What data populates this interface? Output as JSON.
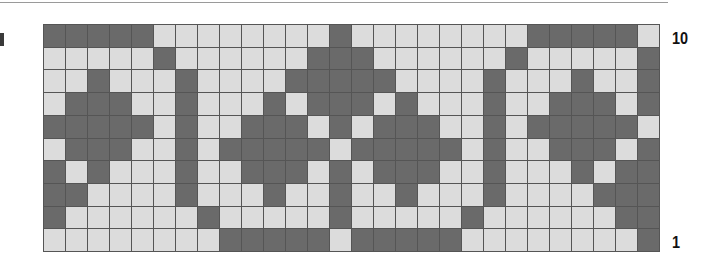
{
  "chart_data": {
    "type": "heatmap",
    "title": "",
    "columns": 28,
    "rows": 10,
    "row_labels": {
      "top": "10",
      "bottom": "1"
    },
    "colors": {
      "dark": "#6a6a6a",
      "light": "#dcdcdc",
      "grid": "#555555"
    },
    "grid": [
      [
        1,
        1,
        1,
        1,
        1,
        0,
        0,
        0,
        0,
        0,
        0,
        0,
        0,
        1,
        0,
        0,
        0,
        0,
        0,
        0,
        0,
        0,
        1,
        1,
        1,
        1,
        1,
        0
      ],
      [
        0,
        0,
        0,
        0,
        0,
        1,
        0,
        0,
        0,
        0,
        0,
        0,
        1,
        1,
        1,
        0,
        0,
        0,
        0,
        0,
        0,
        1,
        0,
        0,
        0,
        0,
        0,
        1
      ],
      [
        0,
        0,
        1,
        0,
        0,
        0,
        1,
        0,
        0,
        0,
        0,
        1,
        1,
        1,
        1,
        1,
        0,
        0,
        0,
        0,
        1,
        0,
        0,
        0,
        1,
        0,
        0,
        1
      ],
      [
        0,
        1,
        1,
        1,
        0,
        0,
        1,
        0,
        0,
        0,
        1,
        0,
        1,
        1,
        1,
        0,
        1,
        0,
        0,
        0,
        1,
        0,
        0,
        1,
        1,
        1,
        0,
        1
      ],
      [
        1,
        1,
        1,
        1,
        1,
        0,
        1,
        0,
        0,
        1,
        1,
        1,
        0,
        1,
        0,
        1,
        1,
        1,
        0,
        0,
        1,
        0,
        1,
        1,
        1,
        1,
        1,
        0
      ],
      [
        0,
        1,
        1,
        1,
        0,
        0,
        1,
        0,
        1,
        1,
        1,
        1,
        1,
        0,
        1,
        1,
        1,
        1,
        1,
        0,
        1,
        0,
        0,
        1,
        1,
        1,
        0,
        1
      ],
      [
        1,
        0,
        1,
        0,
        0,
        0,
        1,
        0,
        0,
        1,
        1,
        1,
        0,
        1,
        0,
        1,
        1,
        1,
        0,
        0,
        1,
        0,
        0,
        0,
        1,
        0,
        1,
        1
      ],
      [
        1,
        1,
        0,
        0,
        0,
        0,
        1,
        0,
        0,
        0,
        1,
        0,
        0,
        1,
        0,
        0,
        1,
        0,
        0,
        0,
        1,
        0,
        0,
        0,
        0,
        1,
        1,
        1
      ],
      [
        1,
        0,
        0,
        0,
        0,
        0,
        0,
        1,
        0,
        0,
        0,
        0,
        0,
        1,
        0,
        0,
        0,
        0,
        0,
        1,
        0,
        0,
        0,
        0,
        0,
        0,
        1,
        1
      ],
      [
        0,
        0,
        0,
        0,
        0,
        0,
        0,
        0,
        1,
        1,
        1,
        1,
        1,
        0,
        1,
        1,
        1,
        1,
        1,
        0,
        0,
        0,
        0,
        0,
        0,
        0,
        0,
        1
      ]
    ]
  },
  "labels": {
    "top_row": "10",
    "bottom_row": "1"
  }
}
